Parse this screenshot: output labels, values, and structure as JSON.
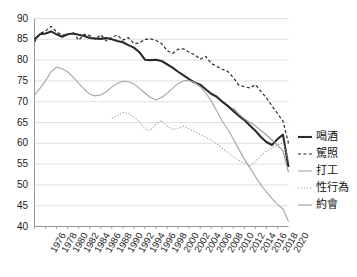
{
  "chart_data": {
    "type": "line",
    "title": "",
    "subtitle": "",
    "xlabel": "",
    "ylabel": "",
    "xlim": [
      1976,
      2022
    ],
    "ylim": [
      40,
      90
    ],
    "yticks": [
      40,
      45,
      50,
      55,
      60,
      65,
      70,
      75,
      80,
      85,
      90
    ],
    "grid": true,
    "grid_axis": "y",
    "legend_position": "right",
    "x": [
      1976,
      1977,
      1978,
      1979,
      1980,
      1981,
      1982,
      1983,
      1984,
      1985,
      1986,
      1987,
      1988,
      1989,
      1990,
      1991,
      1992,
      1993,
      1994,
      1995,
      1996,
      1997,
      1998,
      1999,
      2000,
      2001,
      2002,
      2003,
      2004,
      2005,
      2006,
      2007,
      2008,
      2009,
      2010,
      2011,
      2012,
      2013,
      2014,
      2015,
      2016,
      2017,
      2018,
      2019,
      2020,
      2021,
      2022
    ],
    "xticks": [
      1976,
      1978,
      1980,
      1982,
      1984,
      1986,
      1988,
      1990,
      1992,
      1994,
      1996,
      1998,
      2000,
      2002,
      2004,
      2006,
      2008,
      2010,
      2012,
      2014,
      2016,
      2018,
      2020
    ],
    "xticklabels": [
      "1976",
      "1978",
      "1980",
      "1982",
      "1984",
      "1986",
      "1988",
      "1990",
      "1992",
      "1994",
      "1996",
      "1998",
      "2000",
      "2002",
      "2004",
      "2006",
      "2008",
      "2010",
      "2012",
      "2014",
      "2016",
      "2018",
      "2020"
    ],
    "series": [
      {
        "name": "喝酒",
        "style": "solid",
        "color": "#2b2b2b",
        "width": 2.1,
        "values": [
          85.0,
          86.2,
          86.4,
          86.9,
          86.2,
          85.6,
          86.2,
          86.4,
          86.1,
          85.8,
          85.3,
          85.2,
          85.1,
          85.3,
          85.0,
          84.6,
          84.3,
          83.6,
          83.0,
          81.9,
          80.1,
          80.0,
          80.1,
          79.8,
          79.0,
          78.2,
          77.2,
          76.3,
          75.4,
          74.6,
          74.1,
          73.0,
          71.9,
          71.2,
          70.0,
          69.0,
          67.8,
          66.6,
          65.6,
          64.3,
          63.0,
          61.5,
          60.3,
          59.6,
          61.0,
          62.1,
          54.3
        ]
      },
      {
        "name": "駕照",
        "style": "dashed",
        "color": "#2b2b2b",
        "width": 1.2,
        "values": [
          84.4,
          86.4,
          87.0,
          88.1,
          86.8,
          86.0,
          86.1,
          86.6,
          84.8,
          86.2,
          85.9,
          85.0,
          86.1,
          84.6,
          85.5,
          86.0,
          84.8,
          85.4,
          84.0,
          84.1,
          85.0,
          85.1,
          84.7,
          84.0,
          82.3,
          81.6,
          82.6,
          82.7,
          81.9,
          81.3,
          80.2,
          80.9,
          79.2,
          78.5,
          77.8,
          77.3,
          75.8,
          74.0,
          73.6,
          73.3,
          74.1,
          72.5,
          70.9,
          69.0,
          67.2,
          65.3,
          60.0
        ]
      },
      {
        "name": "打工",
        "style": "solid",
        "color": "#a6a6a6",
        "width": 1.1,
        "values": [
          71.6,
          73.2,
          75.0,
          77.2,
          78.3,
          77.9,
          77.2,
          75.9,
          74.4,
          73.0,
          71.8,
          71.4,
          71.6,
          72.4,
          73.5,
          74.4,
          74.9,
          74.8,
          74.3,
          73.2,
          72.1,
          71.0,
          70.4,
          71.0,
          72.0,
          73.2,
          74.4,
          75.0,
          75.1,
          74.6,
          73.6,
          72.1,
          70.2,
          67.8,
          65.3,
          63.3,
          61.1,
          58.6,
          56.2,
          54.1,
          52.0,
          50.0,
          48.3,
          46.7,
          45.3,
          44.2,
          41.2
        ]
      },
      {
        "name": "性行為",
        "style": "dotted",
        "color": "#a6a6a6",
        "width": 1.1,
        "values": [
          null,
          null,
          null,
          null,
          null,
          null,
          null,
          null,
          null,
          null,
          null,
          null,
          null,
          null,
          66.0,
          66.6,
          67.4,
          67.2,
          66.4,
          65.2,
          63.4,
          63.1,
          64.6,
          65.5,
          64.2,
          63.3,
          63.6,
          64.1,
          63.5,
          62.8,
          62.1,
          61.5,
          60.8,
          59.9,
          58.8,
          57.8,
          56.8,
          55.9,
          55.2,
          54.6,
          55.6,
          57.0,
          58.2,
          58.8,
          59.6,
          60.2,
          56.0
        ]
      },
      {
        "name": "約會",
        "style": "solid",
        "color": "#9a9a9a",
        "width": 1.1,
        "values": [
          null,
          null,
          null,
          null,
          null,
          null,
          null,
          null,
          null,
          null,
          null,
          null,
          null,
          null,
          null,
          null,
          null,
          null,
          null,
          null,
          null,
          null,
          null,
          null,
          null,
          null,
          null,
          null,
          null,
          null,
          null,
          null,
          null,
          null,
          null,
          null,
          68.5,
          67.0,
          65.9,
          65.0,
          64.2,
          63.1,
          62.0,
          60.8,
          59.5,
          58.2,
          53.0
        ]
      }
    ]
  },
  "legend": {
    "items": [
      {
        "label": "喝酒"
      },
      {
        "label": "駕照"
      },
      {
        "label": "打工"
      },
      {
        "label": "性行為"
      },
      {
        "label": "約會"
      }
    ]
  }
}
